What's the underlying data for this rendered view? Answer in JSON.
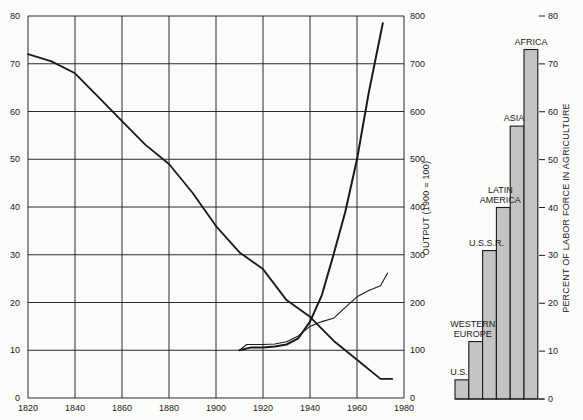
{
  "chart_data": [
    {
      "type": "line",
      "title": "",
      "xlabel": "",
      "ylabel_left": "Percent of labor force in agriculture (U.S.)",
      "ylabel_right": "OUTPUT (1900 = 100)",
      "xlim": [
        1820,
        1980
      ],
      "ylim_left": [
        0,
        80
      ],
      "ylim_right": [
        0,
        800
      ],
      "x_ticks": [
        1820,
        1840,
        1860,
        1880,
        1900,
        1920,
        1940,
        1960,
        1980
      ],
      "y_ticks_left": [
        0,
        10,
        20,
        30,
        40,
        50,
        60,
        70,
        80
      ],
      "y_ticks_right": [
        0,
        100,
        200,
        300,
        400,
        500,
        600,
        700,
        800
      ],
      "grid": true,
      "series": [
        {
          "name": "Agricultural share of labor force",
          "axis": "left",
          "stroke_width": 1.8,
          "x": [
            1820,
            1830,
            1840,
            1850,
            1860,
            1870,
            1880,
            1890,
            1900,
            1910,
            1920,
            1930,
            1940,
            1950,
            1960,
            1970,
            1975
          ],
          "values": [
            72,
            70.5,
            68,
            63,
            58,
            53,
            49,
            43,
            36,
            30.5,
            27,
            20.5,
            17,
            12,
            8,
            4,
            4
          ]
        },
        {
          "name": "Output (steep series)",
          "axis": "right",
          "stroke_width": 2,
          "x": [
            1910,
            1915,
            1920,
            1925,
            1930,
            1935,
            1940,
            1945,
            1950,
            1955,
            1960,
            1965,
            1971
          ],
          "values": [
            100,
            106,
            106,
            108,
            112,
            125,
            160,
            215,
            300,
            390,
            500,
            640,
            785
          ]
        },
        {
          "name": "Output (gradual series)",
          "axis": "right",
          "stroke_width": 1.1,
          "x": [
            1910,
            1913,
            1920,
            1925,
            1930,
            1935,
            1940,
            1945,
            1950,
            1955,
            1960,
            1965,
            1970,
            1973
          ],
          "values": [
            100,
            112,
            112,
            113,
            118,
            130,
            150,
            160,
            167,
            190,
            212,
            225,
            235,
            262
          ]
        }
      ]
    },
    {
      "type": "bar",
      "title": "",
      "xlabel": "",
      "ylabel": "PERCENT OF LABOR FORCE IN AGRICULTURE",
      "ylim": [
        0,
        80
      ],
      "y_ticks": [
        0,
        10,
        20,
        30,
        40,
        50,
        60,
        70,
        80
      ],
      "categories": [
        "U.S.",
        "WESTERN EUROPE",
        "U.S.S.R.",
        "LATIN AMERICA",
        "ASIA",
        "AFRICA"
      ],
      "label_lines": [
        [
          "U.S."
        ],
        [
          "WESTERN",
          "EUROPE"
        ],
        [
          "U.S.S.R."
        ],
        [
          "LATIN",
          "AMERICA"
        ],
        [
          "ASIA"
        ],
        [
          "AFRICA"
        ]
      ],
      "values": [
        4,
        12,
        31,
        40,
        57,
        73
      ],
      "bar_color": "#c4c4c4"
    }
  ],
  "colors": {
    "background": "#fbfbf9",
    "ink": "#1a1a1a",
    "grid": "#2a2a2a",
    "bar_fill": "#c4c4c4"
  }
}
